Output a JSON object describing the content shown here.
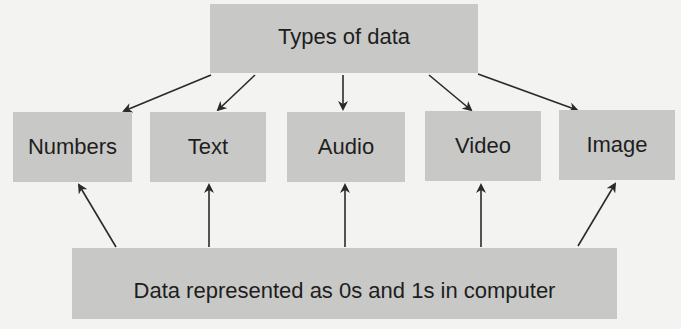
{
  "diagram": {
    "root": {
      "label": "Types of data"
    },
    "types": [
      {
        "label": "Numbers"
      },
      {
        "label": "Text"
      },
      {
        "label": "Audio"
      },
      {
        "label": "Video"
      },
      {
        "label": "Image"
      }
    ],
    "base": {
      "label": "Data represented as 0s and 1s in computer"
    },
    "colors": {
      "background": "#f3f3f1",
      "box_fill": "#c8c8c6",
      "text": "#1e1e1e",
      "arrow": "#2a2a2a"
    }
  }
}
